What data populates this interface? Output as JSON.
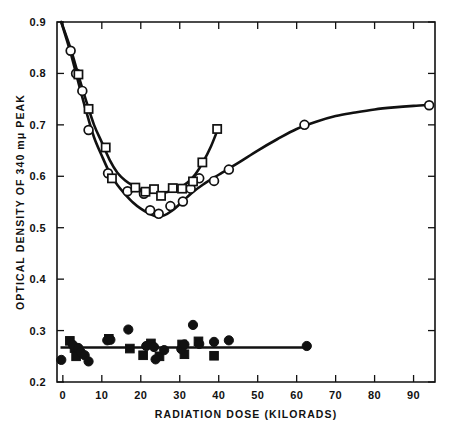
{
  "chart_data": {
    "type": "scatter",
    "title": "",
    "xlabel": "RADIATION DOSE  (KILORADS)",
    "ylabel": "OPTICAL DENSITY OF 340 mμ PEAK",
    "xlim": [
      -1.5,
      95.5
    ],
    "ylim": [
      0.2,
      0.9
    ],
    "xticks": [
      0,
      10,
      20,
      30,
      40,
      50,
      60,
      70,
      80,
      90
    ],
    "xticklabels": [
      "0",
      "10",
      "20",
      "30",
      "40",
      "50",
      "60",
      "70",
      "80",
      "90"
    ],
    "yticks": [
      0.2,
      0.3,
      0.4,
      0.5,
      0.6,
      0.7,
      0.8,
      0.9
    ],
    "yticklabels": [
      "0.2",
      "0.3",
      "0.4",
      "0.5",
      "0.6",
      "0.7",
      "0.8",
      "0.9"
    ],
    "grid": false,
    "legend_position": "none",
    "series": [
      {
        "name": "open-circles",
        "marker": "open-circle",
        "color": "#111111",
        "points": [
          [
            2.0,
            0.844
          ],
          [
            3.4,
            0.8
          ],
          [
            5.0,
            0.766
          ],
          [
            6.6,
            0.69
          ],
          [
            11.6,
            0.606
          ],
          [
            16.6,
            0.571
          ],
          [
            20.8,
            0.566
          ],
          [
            22.4,
            0.534
          ],
          [
            24.6,
            0.527
          ],
          [
            27.6,
            0.542
          ],
          [
            30.8,
            0.551
          ],
          [
            32.8,
            0.576
          ],
          [
            35.0,
            0.596
          ],
          [
            38.8,
            0.591
          ],
          [
            42.6,
            0.613
          ],
          [
            62.0,
            0.7
          ],
          [
            94.0,
            0.738
          ]
        ]
      },
      {
        "name": "open-squares",
        "marker": "open-square",
        "color": "#111111",
        "points": [
          [
            4.0,
            0.798
          ],
          [
            6.6,
            0.731
          ],
          [
            11.0,
            0.656
          ],
          [
            12.6,
            0.596
          ],
          [
            18.6,
            0.578
          ],
          [
            21.2,
            0.57
          ],
          [
            23.4,
            0.575
          ],
          [
            25.2,
            0.562
          ],
          [
            28.2,
            0.577
          ],
          [
            30.6,
            0.576
          ],
          [
            33.4,
            0.59
          ],
          [
            35.8,
            0.627
          ],
          [
            39.6,
            0.692
          ]
        ]
      },
      {
        "name": "filled-circles",
        "marker": "filled-circle",
        "color": "#111111",
        "points": [
          [
            -0.4,
            0.243
          ],
          [
            2.6,
            0.272
          ],
          [
            4.0,
            0.266
          ],
          [
            4.6,
            0.258
          ],
          [
            5.6,
            0.252
          ],
          [
            6.6,
            0.24
          ],
          [
            11.4,
            0.281
          ],
          [
            12.2,
            0.282
          ],
          [
            16.8,
            0.302
          ],
          [
            21.4,
            0.27
          ],
          [
            23.4,
            0.268
          ],
          [
            23.8,
            0.244
          ],
          [
            26.0,
            0.262
          ],
          [
            30.4,
            0.264
          ],
          [
            31.2,
            0.273
          ],
          [
            33.4,
            0.311
          ],
          [
            35.0,
            0.274
          ],
          [
            38.8,
            0.278
          ],
          [
            42.6,
            0.281
          ],
          [
            62.6,
            0.27
          ]
        ]
      },
      {
        "name": "filled-squares",
        "marker": "filled-square",
        "color": "#111111",
        "points": [
          [
            1.8,
            0.28
          ],
          [
            3.0,
            0.266
          ],
          [
            3.4,
            0.25
          ],
          [
            11.8,
            0.284
          ],
          [
            17.2,
            0.265
          ],
          [
            20.6,
            0.252
          ],
          [
            22.6,
            0.275
          ],
          [
            24.8,
            0.25
          ],
          [
            30.6,
            0.273
          ],
          [
            31.2,
            0.254
          ],
          [
            34.8,
            0.279
          ],
          [
            38.8,
            0.251
          ]
        ]
      }
    ],
    "fit_curves": [
      {
        "name": "circle-fit-curve",
        "description": "U-shaped curve for open circles, minimum near 24 kilorads then rising to plateau near 0.74",
        "path": [
          [
            -0.4,
            0.9
          ],
          [
            2.0,
            0.84
          ],
          [
            4.0,
            0.782
          ],
          [
            6.0,
            0.726
          ],
          [
            8.0,
            0.676
          ],
          [
            10.0,
            0.64
          ],
          [
            12.0,
            0.607
          ],
          [
            14.0,
            0.583
          ],
          [
            16.0,
            0.565
          ],
          [
            18.0,
            0.549
          ],
          [
            20.0,
            0.537
          ],
          [
            22.0,
            0.528
          ],
          [
            24.0,
            0.522
          ],
          [
            26.0,
            0.524
          ],
          [
            28.0,
            0.533
          ],
          [
            30.0,
            0.546
          ],
          [
            33.0,
            0.567
          ],
          [
            36.0,
            0.584
          ],
          [
            40.0,
            0.603
          ],
          [
            45.0,
            0.626
          ],
          [
            50.0,
            0.65
          ],
          [
            55.0,
            0.672
          ],
          [
            60.0,
            0.692
          ],
          [
            65.0,
            0.706
          ],
          [
            70.0,
            0.717
          ],
          [
            75.0,
            0.724
          ],
          [
            80.0,
            0.73
          ],
          [
            85.0,
            0.734
          ],
          [
            90.0,
            0.737
          ],
          [
            94.5,
            0.739
          ]
        ]
      },
      {
        "name": "square-fit-curve",
        "description": "U-shaped curve for open squares, shallow minimum near 24 kilorads then steep rise to 0.69 at 40",
        "path": [
          [
            -0.4,
            0.9
          ],
          [
            2.0,
            0.848
          ],
          [
            4.0,
            0.796
          ],
          [
            6.0,
            0.746
          ],
          [
            8.0,
            0.7
          ],
          [
            10.0,
            0.666
          ],
          [
            12.0,
            0.632
          ],
          [
            14.0,
            0.607
          ],
          [
            16.0,
            0.592
          ],
          [
            18.0,
            0.582
          ],
          [
            20.0,
            0.574
          ],
          [
            22.0,
            0.57
          ],
          [
            24.0,
            0.568
          ],
          [
            26.0,
            0.568
          ],
          [
            28.0,
            0.572
          ],
          [
            30.0,
            0.578
          ],
          [
            32.0,
            0.588
          ],
          [
            34.0,
            0.604
          ],
          [
            36.0,
            0.628
          ],
          [
            38.0,
            0.658
          ],
          [
            39.8,
            0.692
          ]
        ]
      },
      {
        "name": "baseline-flat-line",
        "description": "Horizontal line at optical density 0.267 spanning 0 to 63 kilorads",
        "y": 0.267,
        "x_start": -0.6,
        "x_end": 62.8
      }
    ]
  }
}
